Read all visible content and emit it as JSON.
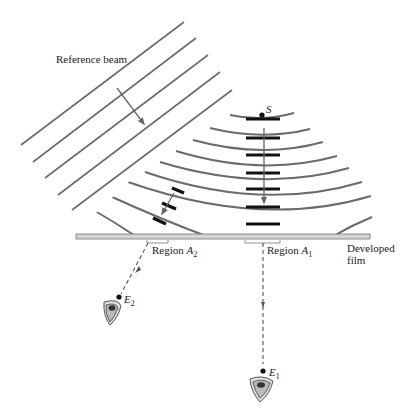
{
  "labels": {
    "reference_beam": "Reference beam",
    "source": "S",
    "region_a2": "Region ",
    "region_a2_sym": "A",
    "region_a2_sub": "2",
    "region_a1": "Region ",
    "region_a1_sym": "A",
    "region_a1_sub": "1",
    "developed": "Developed",
    "film": "film",
    "eye2_sym": "E",
    "eye2_sub": "2",
    "eye1_sym": "E",
    "eye1_sub": "1"
  },
  "colors": {
    "line": "#6b6b6b",
    "dark": "#111111",
    "film_fill": "#d4d4d4"
  }
}
